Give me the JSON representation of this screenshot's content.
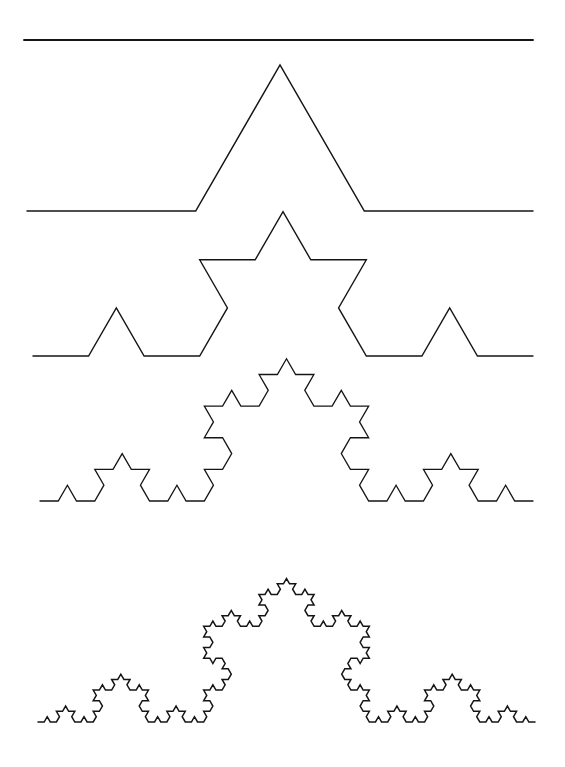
{
  "figure": {
    "name": "koch-curve-iterations",
    "background_color": "#ffffff",
    "stroke_color": "#151515",
    "width": 565,
    "height": 767,
    "iteration_count": 5
  },
  "chart_data": {
    "type": "line",
    "subtitle": "Successive iterations of the Koch curve generator",
    "xlabel": "",
    "ylabel": "",
    "grid": false,
    "legend": "none",
    "xlim": [
      0,
      565
    ],
    "ylim": [
      767,
      0
    ],
    "generator_rule": "Replace each straight segment by four segments of one third the length, with the middle two forming an outward equilateral bump (60 degree turns: +60, -120, +60).",
    "series": [
      {
        "name": "iteration-0",
        "order": 0,
        "segment_count": 1,
        "segment_length_px": 509,
        "total_length_px": 509,
        "start": [
          24,
          40
        ],
        "end": [
          533,
          40
        ],
        "baseline_y": 40,
        "apex_y": 40,
        "peak_height_px": 0,
        "description": "Initiator: a single straight horizontal segment"
      },
      {
        "name": "iteration-1",
        "order": 1,
        "segment_count": 4,
        "segment_length_px": 168.7,
        "total_length_px": 674.7,
        "start": [
          27,
          211
        ],
        "end": [
          533,
          211
        ],
        "baseline_y": 211,
        "apex_y": 62,
        "peak_height_px": 149,
        "description": "Generator: one central equilateral bump"
      },
      {
        "name": "iteration-2",
        "order": 2,
        "segment_count": 16,
        "segment_length_px": 55.6,
        "total_length_px": 889.6,
        "start": [
          33,
          356
        ],
        "end": [
          533,
          356
        ],
        "baseline_y": 356,
        "apex_y": 205,
        "peak_height_px": 151,
        "description": "Second iteration: five visible peaks"
      },
      {
        "name": "iteration-3",
        "order": 3,
        "segment_count": 64,
        "segment_length_px": 18.4,
        "total_length_px": 1177.6,
        "start": [
          40,
          501
        ],
        "end": [
          533,
          501
        ],
        "baseline_y": 501,
        "apex_y": 355,
        "peak_height_px": 146,
        "description": "Third iteration"
      },
      {
        "name": "iteration-4",
        "order": 4,
        "segment_count": 256,
        "segment_length_px": 6.1,
        "total_length_px": 1561.6,
        "start": [
          38,
          722
        ],
        "end": [
          535,
          722
        ],
        "baseline_y": 722,
        "apex_y": 573,
        "peak_height_px": 149,
        "description": "Fourth iteration: self-similar fractal detail"
      }
    ]
  },
  "strokes": {
    "iteration_0": 1.9,
    "iteration_1": 1.5,
    "iteration_2": 1.4,
    "iteration_3": 1.3,
    "iteration_4": 1.5
  }
}
